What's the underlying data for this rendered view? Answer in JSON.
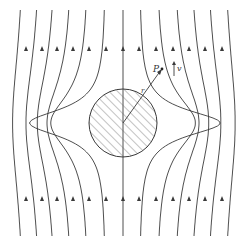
{
  "diagram": {
    "stroke_color": "#3a3a3a",
    "background": "#ffffff",
    "cylinder": {
      "cx": 123,
      "cy": 123,
      "r": 34,
      "fill": "hatched",
      "hatch_color": "#555555"
    },
    "streamlines_x": [
      26,
      42,
      57,
      73,
      89,
      106,
      123,
      139,
      156,
      173,
      189,
      205,
      222
    ],
    "streamline_y_range": [
      10,
      236
    ],
    "arrow_rows_y": [
      50,
      200
    ],
    "arrow_direction": "up",
    "labels": {
      "point": "P",
      "radius": "r",
      "velocity": "v"
    },
    "point_P": {
      "x": 162,
      "y": 69
    },
    "velocity_arrow": {
      "x": 174,
      "y1": 76,
      "y2": 62
    }
  }
}
